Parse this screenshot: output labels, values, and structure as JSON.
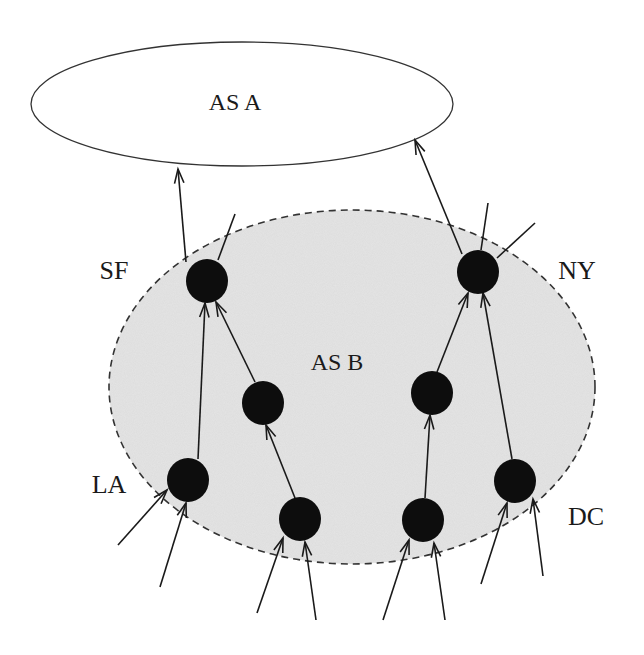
{
  "diagram": {
    "title": "",
    "colors": {
      "background": "#ffffff",
      "as_b_fill": "#dcdcdc",
      "outline": "#333333",
      "node": "#0d0d0d",
      "edge": "#1a1a1a"
    },
    "regions": [
      {
        "id": "as-a",
        "label": "AS A",
        "cx": 242,
        "cy": 104,
        "rx": 211,
        "ry": 62,
        "style": "solid",
        "label_x": 235,
        "label_y": 110,
        "font_size": 24
      },
      {
        "id": "as-b",
        "label": "AS B",
        "cx": 352,
        "cy": 387,
        "rx": 243,
        "ry": 177,
        "style": "dashed",
        "label_x": 337,
        "label_y": 370,
        "font_size": 24
      }
    ],
    "nodes": [
      {
        "id": "sf",
        "label": "SF",
        "x": 207,
        "y": 281,
        "rx": 21,
        "ry": 22,
        "label_x": 114,
        "label_y": 279
      },
      {
        "id": "ny",
        "label": "NY",
        "x": 478,
        "y": 272,
        "rx": 21,
        "ry": 22,
        "label_x": 577,
        "label_y": 279
      },
      {
        "id": "mid-left",
        "label": "",
        "x": 263,
        "y": 403,
        "rx": 21,
        "ry": 22
      },
      {
        "id": "mid-right",
        "label": "",
        "x": 432,
        "y": 393,
        "rx": 21,
        "ry": 22
      },
      {
        "id": "la",
        "label": "LA",
        "x": 188,
        "y": 480,
        "rx": 21,
        "ry": 22,
        "label_x": 109,
        "label_y": 493
      },
      {
        "id": "bottom-left",
        "label": "",
        "x": 300,
        "y": 519,
        "rx": 21,
        "ry": 22
      },
      {
        "id": "bottom-right",
        "label": "",
        "x": 423,
        "y": 520,
        "rx": 21,
        "ry": 22
      },
      {
        "id": "dc",
        "label": "DC",
        "x": 515,
        "y": 481,
        "rx": 21,
        "ry": 22,
        "label_x": 586,
        "label_y": 525
      }
    ],
    "edges": [
      {
        "from": "sf",
        "to": "as-a",
        "x1": 186,
        "y1": 262,
        "x2": 178,
        "y2": 169,
        "arrow": true
      },
      {
        "from": "ny",
        "to": "as-a",
        "x1": 462,
        "y1": 254,
        "x2": 415,
        "y2": 140,
        "arrow": true
      },
      {
        "from": "sf",
        "to": "external",
        "x1": 218,
        "y1": 260,
        "x2": 235,
        "y2": 214,
        "arrow": false
      },
      {
        "from": "ny",
        "to": "external-1",
        "x1": 481,
        "y1": 250,
        "x2": 488,
        "y2": 203,
        "arrow": false
      },
      {
        "from": "ny",
        "to": "external-2",
        "x1": 497,
        "y1": 258,
        "x2": 535,
        "y2": 223,
        "arrow": false
      },
      {
        "from": "la",
        "to": "sf",
        "x1": 198,
        "y1": 459,
        "x2": 205,
        "y2": 303,
        "arrow": true
      },
      {
        "from": "mid-left",
        "to": "sf",
        "x1": 255,
        "y1": 382,
        "x2": 216,
        "y2": 302,
        "arrow": true
      },
      {
        "from": "bottom-left",
        "to": "mid-left",
        "x1": 295,
        "y1": 498,
        "x2": 266,
        "y2": 425,
        "arrow": true
      },
      {
        "from": "mid-right",
        "to": "ny",
        "x1": 437,
        "y1": 372,
        "x2": 468,
        "y2": 293,
        "arrow": true
      },
      {
        "from": "bottom-right",
        "to": "mid-right",
        "x1": 425,
        "y1": 498,
        "x2": 430,
        "y2": 415,
        "arrow": true
      },
      {
        "from": "dc",
        "to": "ny",
        "x1": 512,
        "y1": 459,
        "x2": 483,
        "y2": 293,
        "arrow": true
      },
      {
        "from": "external",
        "to": "la",
        "x1": 118,
        "y1": 545,
        "x2": 167,
        "y2": 490,
        "arrow": true
      },
      {
        "from": "external",
        "to": "la",
        "x1": 160,
        "y1": 587,
        "x2": 186,
        "y2": 503,
        "arrow": true
      },
      {
        "from": "external",
        "to": "bottom-left",
        "x1": 257,
        "y1": 613,
        "x2": 283,
        "y2": 538,
        "arrow": true
      },
      {
        "from": "external",
        "to": "bottom-left",
        "x1": 316,
        "y1": 620,
        "x2": 305,
        "y2": 542,
        "arrow": true
      },
      {
        "from": "external",
        "to": "bottom-right",
        "x1": 383,
        "y1": 620,
        "x2": 409,
        "y2": 540,
        "arrow": true
      },
      {
        "from": "external",
        "to": "bottom-right",
        "x1": 445,
        "y1": 620,
        "x2": 434,
        "y2": 543,
        "arrow": true
      },
      {
        "from": "external",
        "to": "dc",
        "x1": 481,
        "y1": 584,
        "x2": 507,
        "y2": 503,
        "arrow": true
      },
      {
        "from": "external",
        "to": "dc",
        "x1": 543,
        "y1": 576,
        "x2": 533,
        "y2": 499,
        "arrow": true
      }
    ]
  }
}
